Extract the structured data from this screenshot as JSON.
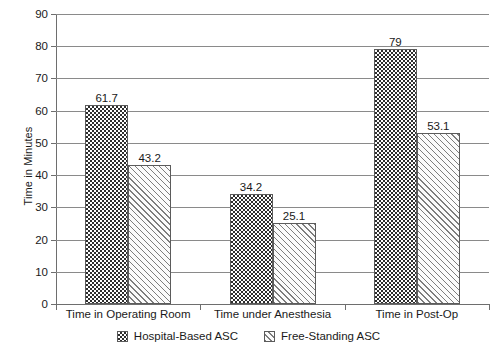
{
  "chart_data": {
    "type": "bar",
    "title": "",
    "subtitle": "",
    "xlabel": "",
    "ylabel": "Time in Minutes",
    "ylim": [
      0,
      90
    ],
    "ytick_step": 10,
    "yticks": [
      0,
      10,
      20,
      30,
      40,
      50,
      60,
      70,
      80,
      90
    ],
    "ytick_labels": [
      "0",
      "10",
      "20",
      "30",
      "40",
      "50",
      "60",
      "70",
      "80",
      "90"
    ],
    "grid": "horizontal",
    "legend_position": "bottom-center",
    "categories": [
      "Time in Operating Room",
      "Time under Anesthesia",
      "Time in Post-Op"
    ],
    "series": [
      {
        "name": "Hospital-Based ASC",
        "pattern": "dotted-dark",
        "color": "#2e2e2e",
        "values": [
          61.7,
          34.2,
          79
        ],
        "labels": [
          "61.7",
          "34.2",
          "79"
        ]
      },
      {
        "name": "Free-Standing ASC",
        "pattern": "diagonal-hatch",
        "color": "#fbfbfb",
        "values": [
          43.2,
          25.1,
          53.1
        ],
        "labels": [
          "43.2",
          "25.1",
          "53.1"
        ]
      }
    ],
    "annotations": []
  },
  "colors": {
    "axis": "#6e6e6e",
    "gridline": "#8a8a8a",
    "text": "#1a1a1a",
    "series_dark": "#2e2e2e",
    "series_hatch_fill": "#fbfbfb",
    "series_hatch_line": "#7d7d7d",
    "background": "#ffffff"
  }
}
